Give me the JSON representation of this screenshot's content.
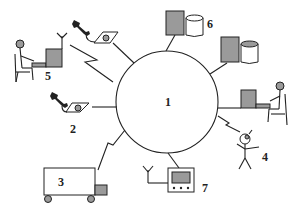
{
  "diagram": {
    "type": "network-hub",
    "hub": {
      "label": "1",
      "shape": "circle"
    },
    "nodes": [
      {
        "id": "2",
        "label": "2",
        "icon": "telephone-icon",
        "link": "wired"
      },
      {
        "id": "3",
        "label": "3",
        "icon": "truck-icon",
        "link": "wireless"
      },
      {
        "id": "4",
        "label": "4",
        "icon": "person-with-phone-icon",
        "link": "wireless"
      },
      {
        "id": "5",
        "label": "5",
        "icon": "seated-user-computer-icon",
        "link": "wireless"
      },
      {
        "id": "6",
        "label": "6",
        "icon": "server-database-icon",
        "link": "wired"
      },
      {
        "id": "7",
        "label": "7",
        "icon": "television-antenna-icon",
        "link": "wired"
      }
    ],
    "unlabeled_nodes": [
      {
        "icon": "telephone-icon",
        "link": "wired",
        "position": "top"
      },
      {
        "icon": "server-database-icon",
        "link": "wired",
        "position": "upper-right"
      },
      {
        "icon": "seated-user-computer-icon",
        "link": "wired",
        "position": "right"
      }
    ],
    "colors": {
      "line": "#222222",
      "fill_shade": "#9a9a9a",
      "background": "#ffffff"
    }
  }
}
